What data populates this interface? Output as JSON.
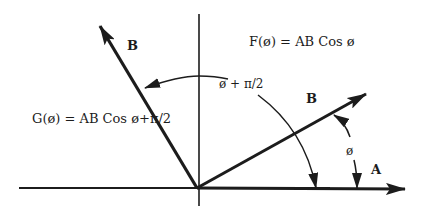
{
  "diagram": {
    "colors": {
      "ink": "#1c1c1c",
      "background": "#ffffff"
    },
    "equations": {
      "f": "F(ø) = AB Cos ø",
      "g": "G(ø) = AB Cos ø+π/2"
    },
    "vectors": {
      "b_rotated": {
        "label": "B"
      },
      "b": {
        "label": "B"
      },
      "a": {
        "label": "A"
      }
    },
    "angles": {
      "phi": "ø",
      "phi_plus_half_pi": "ø + π/2"
    }
  }
}
